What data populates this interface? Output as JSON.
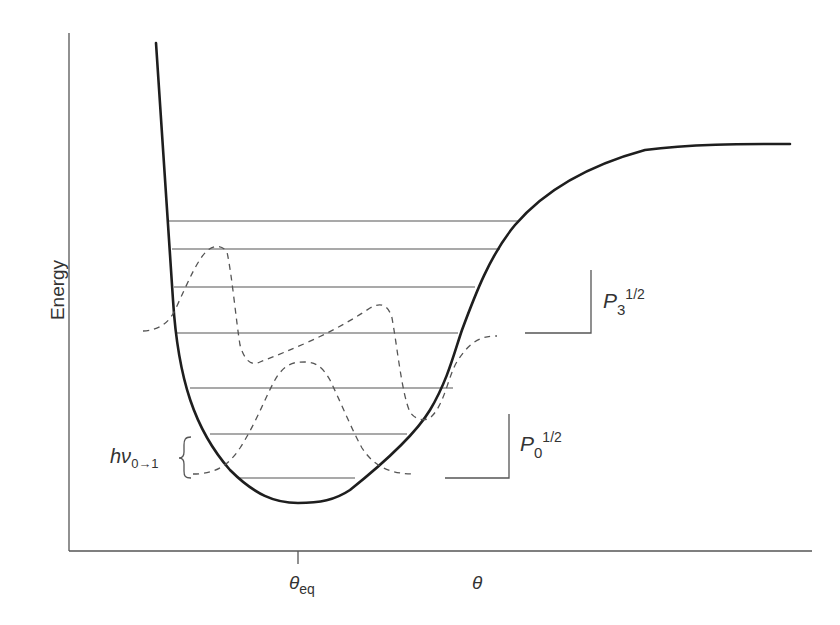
{
  "diagram": {
    "type": "potential-energy-curve",
    "y_axis_label": "Energy",
    "x_axis_label": "θ",
    "x_tick_label_main": "θ",
    "x_tick_label_sub": "eq",
    "energy_levels_count": 7,
    "curve": "Morse-like anharmonic potential (solid, bold)",
    "wavefunctions": [
      {
        "name": "ground-state-probability",
        "style": "dashed",
        "level_index": 0
      },
      {
        "name": "third-excited-probability",
        "style": "dashed",
        "level_index": 3
      }
    ],
    "annotations": {
      "p3": {
        "main": "P",
        "sub": "3",
        "sup": "1/2"
      },
      "p0": {
        "main": "P",
        "sub": "0",
        "sup": "1/2"
      },
      "transition": {
        "main": "hν",
        "sub": "0→1"
      }
    },
    "colors": {
      "curve": "#1e1e1e",
      "lines": "#555555",
      "text": "#333333",
      "background": "#ffffff"
    }
  }
}
